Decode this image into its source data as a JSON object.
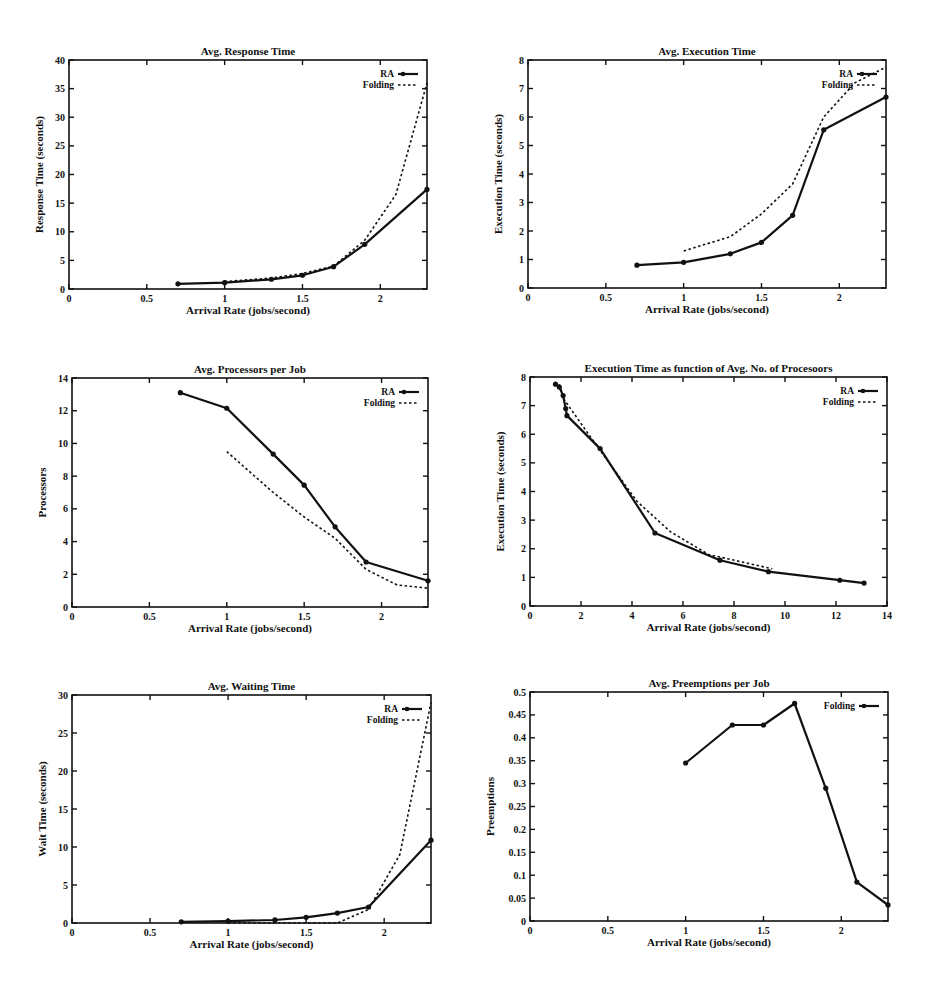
{
  "chart_data": [
    {
      "id": "response",
      "type": "line",
      "title": "Avg. Response Time",
      "xlabel": "Arrival Rate (jobs/second)",
      "ylabel": "Response Time (seconds)",
      "xlim": [
        0,
        2.3
      ],
      "ylim": [
        0,
        40
      ],
      "xticks": [
        0,
        0.5,
        1,
        1.5,
        2
      ],
      "xtick_labels": [
        "0",
        "0.5",
        "1",
        "1.5",
        "2"
      ],
      "yticks": [
        0,
        5,
        10,
        15,
        20,
        25,
        30,
        35,
        40
      ],
      "ytick_labels": [
        "0",
        "5",
        "10",
        "15",
        "20",
        "25",
        "30",
        "35",
        "40"
      ],
      "legend": "top-right",
      "series": [
        {
          "name": "RA",
          "style": "solid-markers",
          "x": [
            0.7,
            1.0,
            1.3,
            1.5,
            1.7,
            1.9,
            2.3
          ],
          "y": [
            0.9,
            1.1,
            1.7,
            2.4,
            3.9,
            7.8,
            17.4
          ]
        },
        {
          "name": "Folding",
          "style": "dotted",
          "x": [
            1.0,
            1.3,
            1.5,
            1.7,
            1.9,
            2.1,
            2.3
          ],
          "y": [
            1.3,
            1.9,
            2.7,
            4.0,
            8.5,
            16.5,
            36.0
          ]
        }
      ]
    },
    {
      "id": "execution",
      "type": "line",
      "title": "Avg. Execution Time",
      "xlabel": "Arrival Rate (jobs/second)",
      "ylabel": "Execution Time (seconds)",
      "xlim": [
        0,
        2.3
      ],
      "ylim": [
        0,
        8
      ],
      "xticks": [
        0,
        0.5,
        1,
        1.5,
        2
      ],
      "xtick_labels": [
        "0",
        "0.5",
        "1",
        "1.5",
        "2"
      ],
      "yticks": [
        0,
        1,
        2,
        3,
        4,
        5,
        6,
        7,
        8
      ],
      "ytick_labels": [
        "0",
        "1",
        "2",
        "3",
        "4",
        "5",
        "6",
        "7",
        "8"
      ],
      "legend": "top-right",
      "series": [
        {
          "name": "RA",
          "style": "solid-markers",
          "x": [
            0.7,
            1.0,
            1.3,
            1.5,
            1.7,
            1.9,
            2.3
          ],
          "y": [
            0.8,
            0.9,
            1.2,
            1.6,
            2.55,
            5.55,
            6.7
          ]
        },
        {
          "name": "Folding",
          "style": "dotted",
          "x": [
            1.0,
            1.3,
            1.5,
            1.7,
            1.9,
            2.1,
            2.3
          ],
          "y": [
            1.3,
            1.8,
            2.6,
            3.65,
            6.0,
            7.2,
            7.75
          ]
        }
      ]
    },
    {
      "id": "processors",
      "type": "line",
      "title": "Avg. Processors per Job",
      "xlabel": "Arrival Rate (jobs/second)",
      "ylabel": "Processors",
      "xlim": [
        0,
        2.3
      ],
      "ylim": [
        0,
        14
      ],
      "xticks": [
        0,
        0.5,
        1,
        1.5,
        2
      ],
      "xtick_labels": [
        "0",
        "0.5",
        "1",
        "1.5",
        "2"
      ],
      "yticks": [
        0,
        2,
        4,
        6,
        8,
        10,
        12,
        14
      ],
      "ytick_labels": [
        "0",
        "2",
        "4",
        "6",
        "8",
        "10",
        "12",
        "14"
      ],
      "legend": "top-right",
      "series": [
        {
          "name": "RA",
          "style": "solid-markers",
          "x": [
            0.7,
            1.0,
            1.3,
            1.5,
            1.7,
            1.9,
            2.3
          ],
          "y": [
            13.1,
            12.15,
            9.35,
            7.45,
            4.9,
            2.75,
            1.6
          ]
        },
        {
          "name": "Folding",
          "style": "dotted",
          "x": [
            1.0,
            1.3,
            1.5,
            1.7,
            1.9,
            2.1,
            2.3
          ],
          "y": [
            9.5,
            7.0,
            5.5,
            4.2,
            2.3,
            1.35,
            1.15
          ]
        }
      ]
    },
    {
      "id": "exec-vs-procs",
      "type": "line",
      "title": "Execution Time as function of Avg. No. of Procesoors",
      "xlabel": "Arrival Rate (jobs/second)",
      "ylabel": "Execution Time (seconds)",
      "xlim": [
        0,
        14
      ],
      "ylim": [
        0,
        8
      ],
      "xticks": [
        0,
        2,
        4,
        6,
        8,
        10,
        12,
        14
      ],
      "xtick_labels": [
        "0",
        "2",
        "4",
        "6",
        "8",
        "10",
        "12",
        "14"
      ],
      "yticks": [
        0,
        1,
        2,
        3,
        4,
        5,
        6,
        7,
        8
      ],
      "ytick_labels": [
        "0",
        "1",
        "2",
        "3",
        "4",
        "5",
        "6",
        "7",
        "8"
      ],
      "legend": "top-right",
      "series": [
        {
          "name": "RA",
          "style": "solid-markers",
          "x": [
            1.0,
            1.15,
            1.3,
            1.4,
            1.45,
            2.75,
            4.9,
            7.45,
            9.35,
            12.15,
            13.1
          ],
          "y": [
            7.75,
            7.65,
            7.35,
            6.9,
            6.65,
            5.5,
            2.55,
            1.6,
            1.2,
            0.9,
            0.8
          ]
        },
        {
          "name": "Folding",
          "style": "dotted",
          "x": [
            1.15,
            1.35,
            2.3,
            4.2,
            5.5,
            7.0,
            9.5
          ],
          "y": [
            7.75,
            7.2,
            6.0,
            3.65,
            2.6,
            1.8,
            1.3
          ]
        }
      ]
    },
    {
      "id": "waiting",
      "type": "line",
      "title": "Avg. Waiting Time",
      "xlabel": "Arrival Rate (jobs/second)",
      "ylabel": "Wait Time (seconds)",
      "xlim": [
        0,
        2.3
      ],
      "ylim": [
        0,
        30
      ],
      "xticks": [
        0,
        0.5,
        1,
        1.5,
        2
      ],
      "xtick_labels": [
        "0",
        "0.5",
        "1",
        "1.5",
        "2"
      ],
      "yticks": [
        0,
        5,
        10,
        15,
        20,
        25,
        30
      ],
      "ytick_labels": [
        "0",
        "5",
        "10",
        "15",
        "20",
        "25",
        "30"
      ],
      "legend": "top-right",
      "series": [
        {
          "name": "RA",
          "style": "solid-markers",
          "x": [
            0.7,
            1.0,
            1.3,
            1.5,
            1.7,
            1.9,
            2.3
          ],
          "y": [
            0.15,
            0.25,
            0.4,
            0.75,
            1.3,
            2.1,
            10.9
          ]
        },
        {
          "name": "Folding",
          "style": "dotted",
          "x": [
            1.0,
            1.3,
            1.5,
            1.7,
            1.9,
            2.1,
            2.3
          ],
          "y": [
            0.0,
            0.0,
            0.0,
            0.0,
            1.8,
            9.0,
            29.0
          ]
        }
      ]
    },
    {
      "id": "preemptions",
      "type": "line",
      "title": "Avg. Preemptions per Job",
      "xlabel": "Arrival Rate (jobs/second)",
      "ylabel": "Preemptions",
      "xlim": [
        0,
        2.3
      ],
      "ylim": [
        0,
        0.5
      ],
      "xticks": [
        0,
        0.5,
        1,
        1.5,
        2
      ],
      "xtick_labels": [
        "0",
        "0.5",
        "1",
        "1.5",
        "2"
      ],
      "yticks": [
        0,
        0.05,
        0.1,
        0.15,
        0.2,
        0.25,
        0.3,
        0.35,
        0.4,
        0.45,
        0.5
      ],
      "ytick_labels": [
        "0",
        "0.05",
        "0.1",
        "0.15",
        "0.2",
        "0.25",
        "0.3",
        "0.35",
        "0.4",
        "0.45",
        "0.5"
      ],
      "legend": "top-right",
      "series": [
        {
          "name": "Folding",
          "style": "solid-markers",
          "x": [
            1.0,
            1.3,
            1.5,
            1.7,
            1.9,
            2.1,
            2.3
          ],
          "y": [
            0.345,
            0.428,
            0.428,
            0.475,
            0.29,
            0.085,
            0.035
          ]
        }
      ]
    }
  ]
}
